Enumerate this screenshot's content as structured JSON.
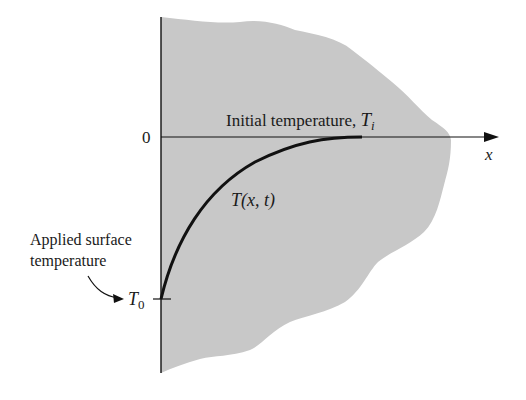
{
  "diagram": {
    "title": "",
    "colors": {
      "medium_fill": "#c8c8c8",
      "ink": "#111111",
      "background": "#ffffff"
    },
    "axes": {
      "origin_label": "0",
      "x_axis_label": "x"
    },
    "labels": {
      "initial_temperature_text": "Initial temperature, ",
      "initial_temperature_symbol": "T",
      "initial_temperature_subscript": "i",
      "curve_label_T": "T",
      "curve_label_args": "(x, t)",
      "applied_surface_line1": "Applied surface",
      "applied_surface_line2": "temperature",
      "surface_symbol": "T",
      "surface_subscript": "0"
    },
    "elements": {
      "curve": "T(x, t) temperature profile rising from T0 at x=0 to Ti",
      "medium": "semi-infinite solid region (shaded)"
    }
  }
}
